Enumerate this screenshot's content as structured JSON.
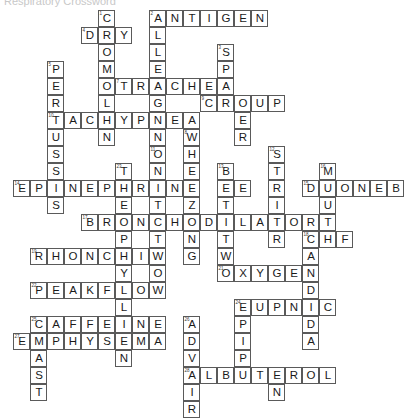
{
  "page": {
    "partial_header_text": "Respiratory Crossword",
    "background_color": "#ffffff",
    "cell_border_color": "#5a5a5a",
    "letter_color": "#1a1a1a",
    "number_color": "#3a3a3a"
  },
  "grid": {
    "cell_size": 17,
    "origin_x": 13,
    "origin_y": 10,
    "columns": 21,
    "rows": 21
  },
  "answers": {
    "across": [
      {
        "number": "2",
        "text": "ANTIGEN",
        "row": 0,
        "col": 8
      },
      {
        "number": "4",
        "text": "DRY",
        "row": 1,
        "col": 4
      },
      {
        "number": "7",
        "text": "TRACHEA",
        "row": 4,
        "col": 6
      },
      {
        "number": "9",
        "text": "CROUP",
        "row": 5,
        "col": 11
      },
      {
        "number": "10",
        "text": "TACHYPNEA",
        "row": 6,
        "col": 2
      },
      {
        "number": "14",
        "text": "EPINEPHRINE",
        "row": 9,
        "col": 0
      },
      {
        "number": "15",
        "text": "DUONEB",
        "row": 9,
        "col": 15
      },
      {
        "number": "17",
        "text": "BRONCHODILATOR",
        "row": 11,
        "col": 4
      },
      {
        "number": "18",
        "text": "CHF",
        "row": 12,
        "col": 16
      },
      {
        "number": "19",
        "text": "RHONCHI",
        "row": 13,
        "col": 1
      },
      {
        "number": "21",
        "text": "OXYGEN",
        "row": 14,
        "col": 12
      },
      {
        "number": "22",
        "text": "PEAKFLOW",
        "row": 15,
        "col": 1
      },
      {
        "number": "24",
        "text": "EUPNIC",
        "row": 17,
        "col": 12
      },
      {
        "number": "25",
        "text": "CAFFEINE",
        "row": 17,
        "col": 1
      },
      {
        "number": "27",
        "text": "EMPHYSEMA",
        "row": 19,
        "col": 0
      },
      {
        "number": "28",
        "text": "ALBUTEROL",
        "row": 20,
        "col": 9
      }
    ],
    "down": [
      {
        "number": "1",
        "text": "COMOLYN",
        "row": 0,
        "col": 5
      },
      {
        "number": "2",
        "text": "ALLERGEN",
        "row": 0,
        "col": 8
      },
      {
        "number": "3",
        "text": "SPACER",
        "row": 2,
        "col": 12
      },
      {
        "number": "5",
        "text": "PERTUSSIS",
        "row": 3,
        "col": 2
      },
      {
        "number": "8",
        "text": "WHEEZING",
        "row": 7,
        "col": 10
      },
      {
        "number": "11",
        "text": "ONETWO",
        "row": 7,
        "col": 8
      },
      {
        "number": "12",
        "text": "STRIDOR",
        "row": 8,
        "col": 13
      },
      {
        "number": "13",
        "text": "BETATWO",
        "row": 8,
        "col": 12
      },
      {
        "number": "16",
        "text": "MOUTH",
        "row": 8,
        "col": 16
      },
      {
        "number": "20",
        "text": "CANDIDA",
        "row": 12,
        "col": 16
      },
      {
        "number": "23",
        "text": "TEPHYLLINE",
        "row": 9,
        "col": 6
      },
      {
        "number": "26",
        "text": "ADVAIR",
        "row": 17,
        "col": 9
      },
      {
        "number": "29",
        "text": "MAST",
        "row": 19,
        "col": 1
      },
      {
        "number": "30",
        "text": "EPIPEN",
        "row": 17,
        "col": 12
      }
    ]
  },
  "cells": [
    {
      "r": 0,
      "c": 5,
      "l": "C",
      "n": "1"
    },
    {
      "r": 0,
      "c": 8,
      "l": "A",
      "n": "2"
    },
    {
      "r": 0,
      "c": 9,
      "l": "N"
    },
    {
      "r": 0,
      "c": 10,
      "l": "T"
    },
    {
      "r": 0,
      "c": 11,
      "l": "I"
    },
    {
      "r": 0,
      "c": 12,
      "l": "G"
    },
    {
      "r": 0,
      "c": 13,
      "l": "E"
    },
    {
      "r": 0,
      "c": 14,
      "l": "N"
    },
    {
      "r": 1,
      "c": 4,
      "l": "D",
      "n": "4"
    },
    {
      "r": 1,
      "c": 5,
      "l": "R"
    },
    {
      "r": 1,
      "c": 6,
      "l": "Y"
    },
    {
      "r": 1,
      "c": 8,
      "l": "L"
    },
    {
      "r": 2,
      "c": 5,
      "l": "O"
    },
    {
      "r": 2,
      "c": 8,
      "l": "L"
    },
    {
      "r": 2,
      "c": 12,
      "l": "S",
      "n": "3"
    },
    {
      "r": 3,
      "c": 2,
      "l": "P",
      "n": "5"
    },
    {
      "r": 3,
      "c": 5,
      "l": "M"
    },
    {
      "r": 3,
      "c": 8,
      "l": "E"
    },
    {
      "r": 3,
      "c": 12,
      "l": "P"
    },
    {
      "r": 4,
      "c": 2,
      "l": "E"
    },
    {
      "r": 4,
      "c": 5,
      "l": "O"
    },
    {
      "r": 4,
      "c": 6,
      "l": "T",
      "n": "7"
    },
    {
      "r": 4,
      "c": 7,
      "l": "R"
    },
    {
      "r": 4,
      "c": 8,
      "l": "A"
    },
    {
      "r": 4,
      "c": 9,
      "l": "C"
    },
    {
      "r": 4,
      "c": 10,
      "l": "H"
    },
    {
      "r": 4,
      "c": 11,
      "l": "E"
    },
    {
      "r": 4,
      "c": 12,
      "l": "A"
    },
    {
      "r": 5,
      "c": 2,
      "l": "R"
    },
    {
      "r": 5,
      "c": 5,
      "l": "L"
    },
    {
      "r": 5,
      "c": 8,
      "l": "G"
    },
    {
      "r": 5,
      "c": 11,
      "l": "C",
      "n": "9"
    },
    {
      "r": 5,
      "c": 12,
      "l": "R"
    },
    {
      "r": 5,
      "c": 13,
      "l": "O"
    },
    {
      "r": 5,
      "c": 14,
      "l": "U"
    },
    {
      "r": 5,
      "c": 15,
      "l": "P"
    },
    {
      "r": 6,
      "c": 2,
      "l": "T",
      "n": "10"
    },
    {
      "r": 6,
      "c": 3,
      "l": "A"
    },
    {
      "r": 6,
      "c": 4,
      "l": "C"
    },
    {
      "r": 6,
      "c": 5,
      "l": "H"
    },
    {
      "r": 6,
      "c": 6,
      "l": "Y"
    },
    {
      "r": 6,
      "c": 7,
      "l": "P"
    },
    {
      "r": 6,
      "c": 8,
      "l": "N"
    },
    {
      "r": 6,
      "c": 9,
      "l": "E"
    },
    {
      "r": 6,
      "c": 10,
      "l": "A"
    },
    {
      "r": 6,
      "c": 13,
      "l": "E"
    },
    {
      "r": 7,
      "c": 2,
      "l": "U"
    },
    {
      "r": 7,
      "c": 5,
      "l": "N"
    },
    {
      "r": 7,
      "c": 8,
      "l": "N"
    },
    {
      "r": 7,
      "c": 10,
      "l": "W",
      "n": "8"
    },
    {
      "r": 7,
      "c": 13,
      "l": "R"
    },
    {
      "r": 8,
      "c": 2,
      "l": "S"
    },
    {
      "r": 8,
      "c": 8,
      "l": "O",
      "n": "11"
    },
    {
      "r": 8,
      "c": 10,
      "l": "H"
    },
    {
      "r": 8,
      "c": 15,
      "l": "S",
      "n": "12"
    },
    {
      "r": 9,
      "c": 2,
      "l": "S"
    },
    {
      "r": 9,
      "c": 6,
      "l": "T",
      "n": "23"
    },
    {
      "r": 9,
      "c": 8,
      "l": "N"
    },
    {
      "r": 9,
      "c": 10,
      "l": "E"
    },
    {
      "r": 9,
      "c": 12,
      "l": "B",
      "n": "13"
    },
    {
      "r": 9,
      "c": 15,
      "l": "T"
    },
    {
      "r": 9,
      "c": 18,
      "l": "M",
      "n": "16"
    },
    {
      "r": 10,
      "c": 0,
      "l": "E",
      "n": "14"
    },
    {
      "r": 10,
      "c": 1,
      "l": "P"
    },
    {
      "r": 10,
      "c": 2,
      "l": "I"
    },
    {
      "r": 10,
      "c": 3,
      "l": "N"
    },
    {
      "r": 10,
      "c": 4,
      "l": "E"
    },
    {
      "r": 10,
      "c": 5,
      "l": "P"
    },
    {
      "r": 10,
      "c": 6,
      "l": "H"
    },
    {
      "r": 10,
      "c": 7,
      "l": "R"
    },
    {
      "r": 10,
      "c": 8,
      "l": "I"
    },
    {
      "r": 10,
      "c": 9,
      "l": "N"
    },
    {
      "r": 10,
      "c": 10,
      "l": "E"
    },
    {
      "r": 10,
      "c": 12,
      "l": "E"
    },
    {
      "r": 10,
      "c": 13,
      "l": "E"
    },
    {
      "r": 10,
      "c": 15,
      "l": "R"
    },
    {
      "r": 10,
      "c": 17,
      "l": "D",
      "n": "15"
    },
    {
      "r": 10,
      "c": 18,
      "l": "U"
    },
    {
      "r": 10,
      "c": 19,
      "l": "O"
    },
    {
      "r": 10,
      "c": 20,
      "l": "N"
    },
    {
      "r": 10,
      "c": 21,
      "l": "E"
    },
    {
      "r": 10,
      "c": 22,
      "l": "B"
    },
    {
      "r": 11,
      "c": 2,
      "l": "S"
    },
    {
      "r": 11,
      "c": 6,
      "l": "E"
    },
    {
      "r": 11,
      "c": 8,
      "l": "T"
    },
    {
      "r": 11,
      "c": 10,
      "l": "Z"
    },
    {
      "r": 11,
      "c": 12,
      "l": "T"
    },
    {
      "r": 11,
      "c": 15,
      "l": "I"
    },
    {
      "r": 11,
      "c": 18,
      "l": "U"
    },
    {
      "r": 12,
      "c": 4,
      "l": "B",
      "n": "17"
    },
    {
      "r": 12,
      "c": 5,
      "l": "R"
    },
    {
      "r": 12,
      "c": 6,
      "l": "O"
    },
    {
      "r": 12,
      "c": 7,
      "l": "N"
    },
    {
      "r": 12,
      "c": 8,
      "l": "C"
    },
    {
      "r": 12,
      "c": 9,
      "l": "H"
    },
    {
      "r": 12,
      "c": 10,
      "l": "O"
    },
    {
      "r": 12,
      "c": 11,
      "l": "D"
    },
    {
      "r": 12,
      "c": 12,
      "l": "I"
    },
    {
      "r": 12,
      "c": 13,
      "l": "L"
    },
    {
      "r": 12,
      "c": 14,
      "l": "A"
    },
    {
      "r": 12,
      "c": 15,
      "l": "T"
    },
    {
      "r": 12,
      "c": 16,
      "l": "O"
    },
    {
      "r": 12,
      "c": 17,
      "l": "R"
    },
    {
      "r": 12,
      "c": 18,
      "l": "T"
    },
    {
      "r": 13,
      "c": 6,
      "l": "P"
    },
    {
      "r": 13,
      "c": 8,
      "l": "T"
    },
    {
      "r": 13,
      "c": 10,
      "l": "N"
    },
    {
      "r": 13,
      "c": 12,
      "l": "T"
    },
    {
      "r": 13,
      "c": 15,
      "l": "R"
    },
    {
      "r": 13,
      "c": 17,
      "l": "C",
      "n": "18"
    },
    {
      "r": 13,
      "c": 18,
      "l": "H"
    },
    {
      "r": 13,
      "c": 19,
      "l": "F"
    },
    {
      "r": 14,
      "c": 1,
      "l": "R",
      "n": "19"
    },
    {
      "r": 14,
      "c": 2,
      "l": "H"
    },
    {
      "r": 14,
      "c": 3,
      "l": "O"
    },
    {
      "r": 14,
      "c": 4,
      "l": "N"
    },
    {
      "r": 14,
      "c": 5,
      "l": "C"
    },
    {
      "r": 14,
      "c": 6,
      "l": "H"
    },
    {
      "r": 14,
      "c": 7,
      "l": "I"
    },
    {
      "r": 14,
      "c": 8,
      "l": "W"
    },
    {
      "r": 14,
      "c": 10,
      "l": "G"
    },
    {
      "r": 14,
      "c": 12,
      "l": "W"
    },
    {
      "r": 14,
      "c": 17,
      "l": "A"
    },
    {
      "r": 15,
      "c": 6,
      "l": "Y"
    },
    {
      "r": 15,
      "c": 8,
      "l": "O"
    },
    {
      "r": 15,
      "c": 12,
      "l": "O",
      "n": "21"
    },
    {
      "r": 15,
      "c": 13,
      "l": "X"
    },
    {
      "r": 15,
      "c": 14,
      "l": "Y"
    },
    {
      "r": 15,
      "c": 15,
      "l": "G"
    },
    {
      "r": 15,
      "c": 16,
      "l": "E"
    },
    {
      "r": 15,
      "c": 17,
      "l": "N"
    },
    {
      "r": 16,
      "c": 1,
      "l": "P",
      "n": "22"
    },
    {
      "r": 16,
      "c": 2,
      "l": "E"
    },
    {
      "r": 16,
      "c": 3,
      "l": "A"
    },
    {
      "r": 16,
      "c": 4,
      "l": "K"
    },
    {
      "r": 16,
      "c": 5,
      "l": "F"
    },
    {
      "r": 16,
      "c": 6,
      "l": "L"
    },
    {
      "r": 16,
      "c": 7,
      "l": "O"
    },
    {
      "r": 16,
      "c": 8,
      "l": "W"
    },
    {
      "r": 16,
      "c": 17,
      "l": "D"
    },
    {
      "r": 17,
      "c": 6,
      "l": "L"
    },
    {
      "r": 17,
      "c": 13,
      "l": "E",
      "n": "24"
    },
    {
      "r": 17,
      "c": 14,
      "l": "U"
    },
    {
      "r": 17,
      "c": 15,
      "l": "P"
    },
    {
      "r": 17,
      "c": 16,
      "l": "N"
    },
    {
      "r": 17,
      "c": 17,
      "l": "I"
    },
    {
      "r": 17,
      "c": 18,
      "l": "C"
    },
    {
      "r": 18,
      "c": 1,
      "l": "C",
      "n": "25"
    },
    {
      "r": 18,
      "c": 2,
      "l": "A"
    },
    {
      "r": 18,
      "c": 3,
      "l": "F"
    },
    {
      "r": 18,
      "c": 4,
      "l": "F"
    },
    {
      "r": 18,
      "c": 5,
      "l": "E"
    },
    {
      "r": 18,
      "c": 6,
      "l": "I"
    },
    {
      "r": 18,
      "c": 7,
      "l": "N"
    },
    {
      "r": 18,
      "c": 8,
      "l": "E"
    },
    {
      "r": 18,
      "c": 10,
      "l": "A",
      "n": "26"
    },
    {
      "r": 18,
      "c": 13,
      "l": "P"
    },
    {
      "r": 18,
      "c": 17,
      "l": "D"
    },
    {
      "r": 19,
      "c": 0,
      "l": "E",
      "n": "27"
    },
    {
      "r": 19,
      "c": 1,
      "l": "M"
    },
    {
      "r": 19,
      "c": 2,
      "l": "P"
    },
    {
      "r": 19,
      "c": 3,
      "l": "H"
    },
    {
      "r": 19,
      "c": 4,
      "l": "Y"
    },
    {
      "r": 19,
      "c": 5,
      "l": "S"
    },
    {
      "r": 19,
      "c": 6,
      "l": "E"
    },
    {
      "r": 19,
      "c": 7,
      "l": "M"
    },
    {
      "r": 19,
      "c": 8,
      "l": "A"
    },
    {
      "r": 19,
      "c": 10,
      "l": "D"
    },
    {
      "r": 19,
      "c": 13,
      "l": "I"
    },
    {
      "r": 19,
      "c": 17,
      "l": "A"
    },
    {
      "r": 20,
      "c": 1,
      "l": "A"
    },
    {
      "r": 20,
      "c": 6,
      "l": "N"
    },
    {
      "r": 20,
      "c": 10,
      "l": "V"
    },
    {
      "r": 20,
      "c": 13,
      "l": "P"
    },
    {
      "r": 21,
      "c": 1,
      "l": "S"
    },
    {
      "r": 21,
      "c": 10,
      "l": "A",
      "n": "28"
    },
    {
      "r": 21,
      "c": 11,
      "l": "L"
    },
    {
      "r": 21,
      "c": 12,
      "l": "B"
    },
    {
      "r": 21,
      "c": 13,
      "l": "U"
    },
    {
      "r": 21,
      "c": 14,
      "l": "T"
    },
    {
      "r": 21,
      "c": 15,
      "l": "E"
    },
    {
      "r": 21,
      "c": 16,
      "l": "R"
    },
    {
      "r": 21,
      "c": 17,
      "l": "O"
    },
    {
      "r": 21,
      "c": 18,
      "l": "L"
    },
    {
      "r": 22,
      "c": 1,
      "l": "T"
    },
    {
      "r": 22,
      "c": 10,
      "l": "I"
    },
    {
      "r": 22,
      "c": 15,
      "l": "N"
    },
    {
      "r": 23,
      "c": 10,
      "l": "R"
    }
  ]
}
